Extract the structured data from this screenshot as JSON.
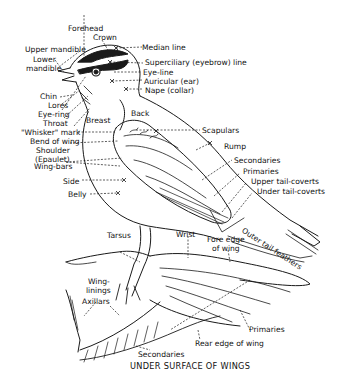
{
  "labels": {
    "forehead": "Forehead",
    "crown": "Crown",
    "upper_mandible": "Upper mandible",
    "lower_mandible_1": "Lower",
    "lower_mandible_2": "mandible",
    "median_line": "Median line",
    "superciliary": "Superciliary (eyebrow) line",
    "eye_line": "Eye-line",
    "auricular": "Auricular (ear)",
    "nape": "Nape (collar)",
    "chin": "Chin",
    "lores": "Lores",
    "eye_ring": "Eye-ring",
    "throat": "Throat",
    "whisker": "\"Whisker\" mark",
    "breast": "Breast",
    "back": "Back",
    "bend_of_wing": "Bend of wing",
    "shoulder_1": "Shoulder",
    "shoulder_2": "(Epaulet)",
    "scapulars": "Scapulars",
    "rump": "Rump",
    "wing_bars": "Wing-bars",
    "secondaries_upper": "Secondaries",
    "primaries_upper": "Primaries",
    "upper_tail_coverts": "Upper tail-coverts",
    "under_tail_coverts": "Under tail-coverts",
    "side": "Side",
    "belly": "Belly",
    "tarsus": "Tarsus",
    "wrist": "Wrist",
    "fore_edge_1": "Fore edge",
    "fore_edge_2": "of wing",
    "outer_tail_feathers": "Outer tail feathers",
    "wing_linings_1": "Wing-",
    "wing_linings_2": "linings",
    "axillars": "Axillars",
    "primaries_under": "Primaries",
    "rear_edge": "Rear edge of wing",
    "secondaries_under": "Secondaries",
    "caption": "UNDER SURFACE OF WINGS"
  },
  "colors": {
    "ink": "#1a1a1a",
    "background": "#ffffff"
  }
}
